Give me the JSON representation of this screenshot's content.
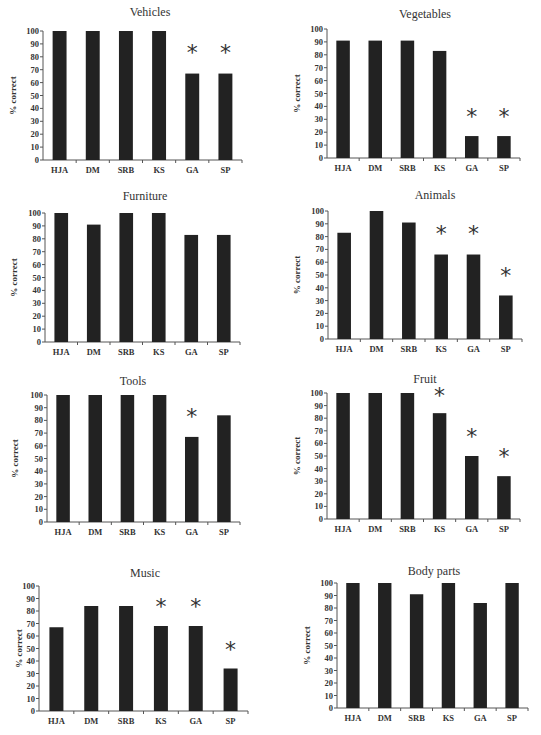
{
  "chart_data": [
    {
      "type": "bar",
      "title": "Vehicles",
      "xlabel": "",
      "ylabel": "% correct",
      "ylim": [
        0,
        100
      ],
      "yticks": [
        0,
        10,
        20,
        30,
        40,
        50,
        60,
        70,
        80,
        90,
        100
      ],
      "categories": [
        "HJA",
        "DM",
        "SRB",
        "KS",
        "GA",
        "SP"
      ],
      "values": [
        100,
        100,
        100,
        100,
        67,
        67
      ],
      "significant": [
        false,
        false,
        false,
        false,
        true,
        true
      ],
      "annotation": "*",
      "grid": false
    },
    {
      "type": "bar",
      "title": "Vegetables",
      "xlabel": "",
      "ylabel": "% correct",
      "ylim": [
        0,
        100
      ],
      "yticks": [
        0,
        10,
        20,
        30,
        40,
        50,
        60,
        70,
        80,
        90,
        100
      ],
      "categories": [
        "HJA",
        "DM",
        "SRB",
        "KS",
        "GA",
        "SP"
      ],
      "values": [
        91,
        91,
        91,
        83,
        17,
        17
      ],
      "significant": [
        false,
        false,
        false,
        false,
        true,
        true
      ],
      "annotation": "*",
      "grid": false
    },
    {
      "type": "bar",
      "title": "Furniture",
      "xlabel": "",
      "ylabel": "% correct",
      "ylim": [
        0,
        100
      ],
      "yticks": [
        0,
        10,
        20,
        30,
        40,
        50,
        60,
        70,
        80,
        90,
        100
      ],
      "categories": [
        "HJA",
        "DM",
        "SRB",
        "KS",
        "GA",
        "SP"
      ],
      "values": [
        100,
        91,
        100,
        100,
        83,
        83
      ],
      "significant": [
        false,
        false,
        false,
        false,
        false,
        false
      ],
      "annotation": "*",
      "grid": false
    },
    {
      "type": "bar",
      "title": "Animals",
      "xlabel": "",
      "ylabel": "% correct",
      "ylim": [
        0,
        100
      ],
      "yticks": [
        0,
        10,
        20,
        30,
        40,
        50,
        60,
        70,
        80,
        90,
        100
      ],
      "categories": [
        "HJA",
        "DM",
        "SRB",
        "KS",
        "GA",
        "SP"
      ],
      "values": [
        83,
        100,
        91,
        66,
        66,
        34
      ],
      "significant": [
        false,
        false,
        false,
        true,
        true,
        true
      ],
      "annotation": "*",
      "grid": false
    },
    {
      "type": "bar",
      "title": "Tools",
      "xlabel": "",
      "ylabel": "% correct",
      "ylim": [
        0,
        100
      ],
      "yticks": [
        0,
        10,
        20,
        30,
        40,
        50,
        60,
        70,
        80,
        90,
        100
      ],
      "categories": [
        "HJA",
        "DM",
        "SRB",
        "KS",
        "GA",
        "SP"
      ],
      "values": [
        100,
        100,
        100,
        100,
        67,
        84
      ],
      "significant": [
        false,
        false,
        false,
        false,
        true,
        false
      ],
      "annotation": "*",
      "grid": false
    },
    {
      "type": "bar",
      "title": "Fruit",
      "xlabel": "",
      "ylabel": "% correct",
      "ylim": [
        0,
        100
      ],
      "yticks": [
        0,
        10,
        20,
        30,
        40,
        50,
        60,
        70,
        80,
        90,
        100
      ],
      "categories": [
        "HJA",
        "DM",
        "SRB",
        "KS",
        "GA",
        "SP"
      ],
      "values": [
        100,
        100,
        100,
        84,
        50,
        34
      ],
      "significant": [
        false,
        false,
        false,
        true,
        true,
        true
      ],
      "annotation": "*",
      "grid": false
    },
    {
      "type": "bar",
      "title": "Music",
      "xlabel": "",
      "ylabel": "% correct",
      "ylim": [
        0,
        100
      ],
      "yticks": [
        0,
        10,
        20,
        30,
        40,
        50,
        60,
        70,
        80,
        90,
        100
      ],
      "categories": [
        "HJA",
        "DM",
        "SRB",
        "KS",
        "GA",
        "SP"
      ],
      "values": [
        67,
        84,
        84,
        68,
        68,
        34
      ],
      "significant": [
        false,
        false,
        false,
        true,
        true,
        true
      ],
      "annotation": "*",
      "grid": false
    },
    {
      "type": "bar",
      "title": "Body parts",
      "xlabel": "",
      "ylabel": "% correct",
      "ylim": [
        0,
        100
      ],
      "yticks": [
        0,
        10,
        20,
        30,
        40,
        50,
        60,
        70,
        80,
        90,
        100
      ],
      "categories": [
        "HJA",
        "DM",
        "SRB",
        "KS",
        "GA",
        "SP"
      ],
      "values": [
        100,
        100,
        91,
        100,
        84,
        100
      ],
      "significant": [
        false,
        false,
        false,
        false,
        false,
        false
      ],
      "annotation": "*",
      "grid": false
    }
  ],
  "colors": {
    "bar": "#222222",
    "axis": "#555555",
    "text": "#333333",
    "background": "#ffffff"
  }
}
